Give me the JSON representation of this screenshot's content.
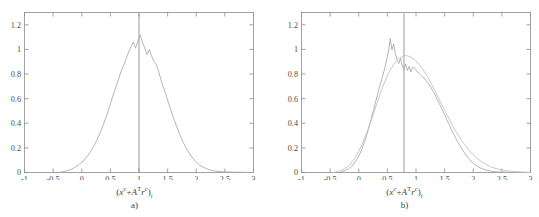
{
  "figure": {
    "background": "#ffffff",
    "curve_color": "#a8a8a8",
    "smooth_curve_color": "#bdbdbd",
    "axis_color": "#8c8c8c",
    "text_color": "#4d4d4d"
  },
  "axis_label": {
    "open_paren": "(",
    "x_symbol": "x",
    "x_superscript": "c",
    "plus": "+",
    "A_symbol": "A",
    "A_superscript": "T",
    "r_symbol": "r",
    "r_superscript": "c",
    "close_paren": ")",
    "subscript": "i",
    "plain": "(xᶜ + Aᵀ rᶜ)ᵢ"
  },
  "panels": [
    {
      "id": "a",
      "caption": "a)",
      "reference_line_x": 1.0
    },
    {
      "id": "b",
      "caption": "b)",
      "reference_line_x": 0.79
    }
  ],
  "chart_data": [
    {
      "type": "line",
      "panel": "a",
      "title": "",
      "xlabel": "(x^c + A^T r^c)_i",
      "ylabel": "",
      "xlim": [
        -1,
        3
      ],
      "ylim": [
        0,
        1.3
      ],
      "xticks": [
        -1,
        -0.5,
        0,
        0.5,
        1,
        1.5,
        2,
        2.5,
        3
      ],
      "xticklabels": [
        "-1",
        "-0.5",
        "0",
        "0.5",
        "1",
        "1.5",
        "2",
        "2.5",
        "3"
      ],
      "yticks": [
        0,
        0.2,
        0.4,
        0.6,
        0.8,
        1,
        1.2
      ],
      "yticklabels": [
        "0",
        "0.2",
        "0.4",
        "0.6",
        "0.8",
        "1",
        "1.2"
      ],
      "grid": false,
      "legend": "none",
      "annotations": [
        {
          "type": "vline",
          "x": 1.0,
          "label": ""
        }
      ],
      "series": [
        {
          "name": "empirical histogram",
          "style": "jagged",
          "peak_x": 1.0,
          "peak_y": 1.12,
          "x": [
            -0.4,
            -0.35,
            -0.3,
            -0.26,
            -0.22,
            -0.18,
            -0.14,
            -0.1,
            -0.06,
            -0.02,
            0.02,
            0.06,
            0.1,
            0.14,
            0.18,
            0.22,
            0.26,
            0.3,
            0.34,
            0.38,
            0.42,
            0.46,
            0.5,
            0.54,
            0.58,
            0.62,
            0.66,
            0.7,
            0.74,
            0.78,
            0.82,
            0.86,
            0.9,
            0.94,
            0.98,
            1.02,
            1.06,
            1.1,
            1.14,
            1.18,
            1.22,
            1.26,
            1.3,
            1.34,
            1.38,
            1.42,
            1.46,
            1.5,
            1.54,
            1.58,
            1.62,
            1.66,
            1.7,
            1.74,
            1.78,
            1.82,
            1.86,
            1.9,
            1.94,
            1.98,
            2.02,
            2.06,
            2.1,
            2.16,
            2.22,
            2.3,
            2.4,
            2.55,
            2.75,
            3.0
          ],
          "y": [
            0.0,
            0.004,
            0.009,
            0.014,
            0.02,
            0.028,
            0.036,
            0.048,
            0.06,
            0.074,
            0.092,
            0.112,
            0.134,
            0.16,
            0.19,
            0.222,
            0.258,
            0.3,
            0.344,
            0.392,
            0.444,
            0.498,
            0.556,
            0.616,
            0.672,
            0.726,
            0.784,
            0.836,
            0.88,
            0.93,
            0.978,
            1.022,
            1.06,
            1.01,
            1.068,
            1.118,
            1.06,
            1.012,
            0.958,
            1.0,
            0.946,
            0.902,
            0.88,
            0.826,
            0.76,
            0.7,
            0.648,
            0.588,
            0.53,
            0.474,
            0.42,
            0.372,
            0.322,
            0.278,
            0.238,
            0.202,
            0.17,
            0.142,
            0.116,
            0.094,
            0.076,
            0.06,
            0.048,
            0.034,
            0.024,
            0.014,
            0.008,
            0.004,
            0.002,
            0.0
          ]
        }
      ]
    },
    {
      "type": "line",
      "panel": "b",
      "title": "",
      "xlabel": "(x^c + A^T r^c)_i",
      "ylabel": "",
      "xlim": [
        -1,
        3
      ],
      "ylim": [
        0,
        1.3
      ],
      "xticks": [
        -1,
        -0.5,
        0,
        0.5,
        1,
        1.5,
        2,
        2.5,
        3
      ],
      "xticklabels": [
        "-1",
        "-0.5",
        "0",
        "0.5",
        "1",
        "1.5",
        "2",
        "2.5",
        "3"
      ],
      "yticks": [
        0,
        0.2,
        0.4,
        0.6,
        0.8,
        1,
        1.2
      ],
      "yticklabels": [
        "0",
        "0.2",
        "0.4",
        "0.6",
        "0.8",
        "1",
        "1.2"
      ],
      "grid": false,
      "legend": "none",
      "annotations": [
        {
          "type": "vline",
          "x": 0.79,
          "label": ""
        }
      ],
      "series": [
        {
          "name": "empirical histogram",
          "style": "jagged",
          "peak_x": 0.55,
          "peak_y": 1.09,
          "x": [
            -0.34,
            -0.3,
            -0.26,
            -0.22,
            -0.18,
            -0.14,
            -0.1,
            -0.06,
            -0.02,
            0.02,
            0.06,
            0.1,
            0.14,
            0.18,
            0.22,
            0.26,
            0.3,
            0.34,
            0.38,
            0.42,
            0.46,
            0.5,
            0.53,
            0.55,
            0.58,
            0.61,
            0.64,
            0.67,
            0.7,
            0.73,
            0.76,
            0.79,
            0.82,
            0.85,
            0.88,
            0.91,
            0.94,
            0.98,
            1.02,
            1.06,
            1.1,
            1.14,
            1.18,
            1.22,
            1.26,
            1.3,
            1.34,
            1.38,
            1.42,
            1.46,
            1.5,
            1.54,
            1.58,
            1.62,
            1.66,
            1.7,
            1.74,
            1.78,
            1.82,
            1.86,
            1.9,
            1.94,
            1.98,
            2.02,
            2.08,
            2.14,
            2.22,
            2.32,
            2.45,
            2.65,
            3.0
          ],
          "y": [
            0.0,
            0.006,
            0.012,
            0.02,
            0.03,
            0.044,
            0.062,
            0.086,
            0.116,
            0.152,
            0.196,
            0.248,
            0.306,
            0.372,
            0.44,
            0.51,
            0.584,
            0.654,
            0.724,
            0.788,
            0.856,
            0.944,
            1.01,
            1.09,
            0.996,
            1.042,
            0.962,
            0.916,
            0.886,
            0.926,
            0.866,
            0.838,
            0.882,
            0.828,
            0.862,
            0.818,
            0.856,
            0.846,
            0.82,
            0.8,
            0.782,
            0.768,
            0.744,
            0.72,
            0.692,
            0.66,
            0.624,
            0.586,
            0.548,
            0.508,
            0.468,
            0.428,
            0.388,
            0.348,
            0.31,
            0.274,
            0.24,
            0.208,
            0.178,
            0.15,
            0.126,
            0.104,
            0.084,
            0.068,
            0.048,
            0.034,
            0.02,
            0.01,
            0.004,
            0.001,
            0.0
          ]
        },
        {
          "name": "reference density",
          "style": "smooth",
          "peak_x": 0.8,
          "peak_y": 0.95,
          "x": [
            -0.45,
            -0.4,
            -0.35,
            -0.3,
            -0.25,
            -0.2,
            -0.15,
            -0.1,
            -0.05,
            0.0,
            0.05,
            0.1,
            0.15,
            0.2,
            0.25,
            0.3,
            0.35,
            0.4,
            0.45,
            0.5,
            0.55,
            0.6,
            0.65,
            0.7,
            0.75,
            0.8,
            0.85,
            0.9,
            0.95,
            1.0,
            1.05,
            1.1,
            1.15,
            1.2,
            1.25,
            1.3,
            1.35,
            1.4,
            1.45,
            1.5,
            1.55,
            1.6,
            1.65,
            1.7,
            1.75,
            1.8,
            1.85,
            1.9,
            1.95,
            2.0,
            2.05,
            2.1,
            2.15,
            2.2,
            2.3,
            2.4,
            2.55,
            2.75,
            3.0
          ],
          "y": [
            0.0,
            0.004,
            0.01,
            0.018,
            0.03,
            0.046,
            0.068,
            0.096,
            0.13,
            0.172,
            0.22,
            0.274,
            0.334,
            0.4,
            0.468,
            0.538,
            0.606,
            0.672,
            0.732,
            0.786,
            0.832,
            0.87,
            0.9,
            0.924,
            0.94,
            0.95,
            0.948,
            0.94,
            0.926,
            0.906,
            0.88,
            0.85,
            0.816,
            0.778,
            0.736,
            0.692,
            0.646,
            0.6,
            0.552,
            0.506,
            0.46,
            0.416,
            0.372,
            0.332,
            0.294,
            0.258,
            0.226,
            0.196,
            0.168,
            0.144,
            0.122,
            0.102,
            0.086,
            0.072,
            0.048,
            0.032,
            0.016,
            0.006,
            0.0
          ]
        }
      ]
    }
  ]
}
